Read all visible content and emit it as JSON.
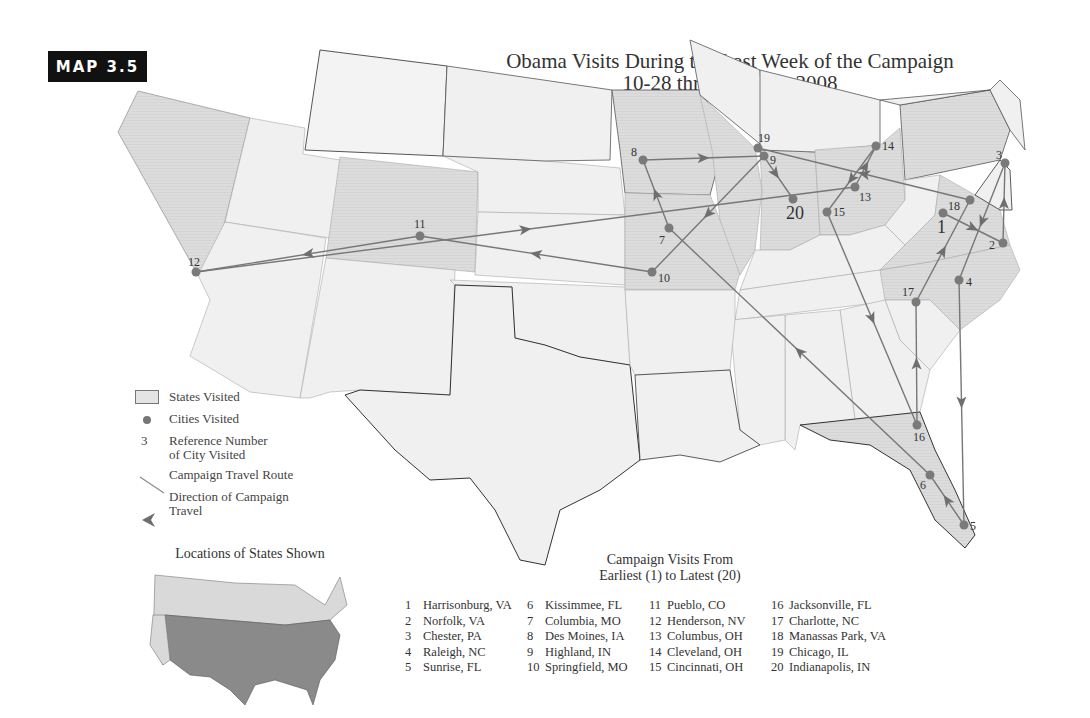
{
  "badge": "MAP 3.5",
  "title": {
    "line1": "Obama Visits During the Last Week of the Campaign",
    "line2": "10-28 through 11-3, 2008"
  },
  "legend": {
    "states_visited": "States Visited",
    "cities_visited": "Cities Visited",
    "ref_number_symbol": "3",
    "ref_number_line1": "Reference Number",
    "ref_number_line2": "of City Visited",
    "route": "Campaign Travel Route",
    "direction_line1": "Direction of Campaign",
    "direction_line2": "Travel"
  },
  "inset": {
    "title": "Locations of States Shown"
  },
  "visits_header": {
    "line1": "Campaign Visits From",
    "line2": "Earliest (1) to Latest (20)"
  },
  "colors": {
    "state_fill": "#f0f0f0",
    "visited_fill": "#dcdcdc",
    "route": "#777777",
    "city": "#7a7a7a",
    "badge_bg": "#111111",
    "inset_highlight": "#8a8a8a",
    "inset_other": "#d9d9d9"
  },
  "cities": [
    {
      "n": 1,
      "name": "Harrisonburg, VA"
    },
    {
      "n": 2,
      "name": "Norfolk, VA"
    },
    {
      "n": 3,
      "name": "Chester, PA"
    },
    {
      "n": 4,
      "name": "Raleigh, NC"
    },
    {
      "n": 5,
      "name": "Sunrise, FL"
    },
    {
      "n": 6,
      "name": "Kissimmee, FL"
    },
    {
      "n": 7,
      "name": "Columbia, MO"
    },
    {
      "n": 8,
      "name": "Des Moines, IA"
    },
    {
      "n": 9,
      "name": "Highland, IN"
    },
    {
      "n": 10,
      "name": "Springfield, MO"
    },
    {
      "n": 11,
      "name": "Pueblo, CO"
    },
    {
      "n": 12,
      "name": "Henderson, NV"
    },
    {
      "n": 13,
      "name": "Columbus, OH"
    },
    {
      "n": 14,
      "name": "Cleveland, OH"
    },
    {
      "n": 15,
      "name": "Cincinnati, OH"
    },
    {
      "n": 16,
      "name": "Jacksonville, FL"
    },
    {
      "n": 17,
      "name": "Charlotte, NC"
    },
    {
      "n": 18,
      "name": "Manassas Park, VA"
    },
    {
      "n": 19,
      "name": "Chicago, IL"
    },
    {
      "n": 20,
      "name": "Indianapolis, IN"
    }
  ],
  "states_visited": [
    "NV",
    "CO",
    "IA",
    "MO",
    "IL",
    "IN",
    "OH",
    "PA",
    "VA",
    "NC",
    "FL"
  ]
}
